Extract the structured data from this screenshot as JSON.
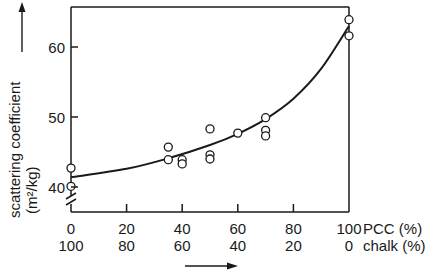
{
  "chart_data": {
    "type": "scatter",
    "title": "",
    "xlabel": "PCC (%)",
    "xlabel_secondary": "chalk (%)",
    "ylabel": "scattering coefficient",
    "ylabel_units": "(m²/kg)",
    "xlim": [
      0,
      100
    ],
    "ylim": [
      38,
      64.5
    ],
    "y_axis_break": true,
    "grid": false,
    "legend": null,
    "x_ticks": [
      0,
      20,
      40,
      60,
      80,
      100
    ],
    "x_tick_labels_pcc": [
      "0",
      "20",
      "40",
      "60",
      "80",
      "100"
    ],
    "x_tick_labels_chalk": [
      "100",
      "80",
      "60",
      "40",
      "20",
      "0"
    ],
    "y_ticks": [
      40,
      50,
      60
    ],
    "y_tick_labels": [
      "40",
      "50",
      "60"
    ],
    "series": [
      {
        "name": "measured",
        "marker": "open-circle",
        "points": [
          {
            "x": 0,
            "y": 42.7
          },
          {
            "x": 0,
            "y": 40.1
          },
          {
            "x": 35,
            "y": 45.7
          },
          {
            "x": 35,
            "y": 43.9
          },
          {
            "x": 40,
            "y": 43.9
          },
          {
            "x": 40,
            "y": 43.3
          },
          {
            "x": 50,
            "y": 48.3
          },
          {
            "x": 50,
            "y": 44.6
          },
          {
            "x": 50,
            "y": 44.0
          },
          {
            "x": 60,
            "y": 47.7
          },
          {
            "x": 70,
            "y": 49.9
          },
          {
            "x": 70,
            "y": 48.1
          },
          {
            "x": 70,
            "y": 47.3
          },
          {
            "x": 100,
            "y": 63.9
          },
          {
            "x": 100,
            "y": 61.6
          }
        ]
      },
      {
        "name": "fitted curve",
        "marker": "line",
        "points": [
          {
            "x": 0,
            "y": 41.4
          },
          {
            "x": 20,
            "y": 42.6
          },
          {
            "x": 35,
            "y": 44.1
          },
          {
            "x": 50,
            "y": 46.0
          },
          {
            "x": 60,
            "y": 47.6
          },
          {
            "x": 70,
            "y": 49.7
          },
          {
            "x": 80,
            "y": 52.6
          },
          {
            "x": 90,
            "y": 56.9
          },
          {
            "x": 100,
            "y": 63.0
          }
        ]
      }
    ]
  }
}
